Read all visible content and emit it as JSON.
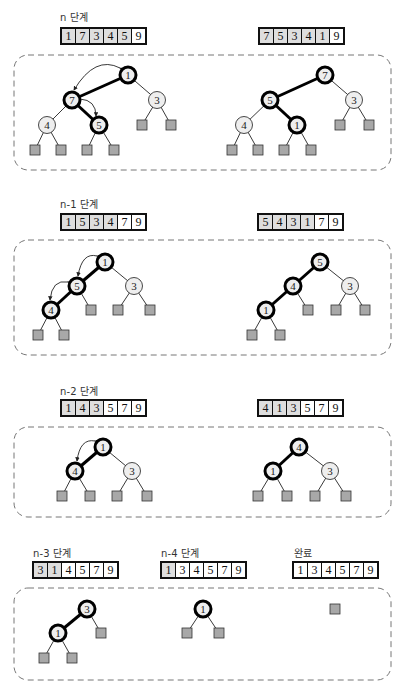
{
  "colors": {
    "edge": "#222222",
    "highlight": "#000000",
    "node_fill": "#eeeeee",
    "leaf_fill": "#a8a8a8",
    "dash": "#777777"
  },
  "stages": [
    {
      "label": "n 단계",
      "before_array": [
        {
          "v": "1",
          "s": true
        },
        {
          "v": "7",
          "s": true
        },
        {
          "v": "3",
          "s": true
        },
        {
          "v": "4",
          "s": true
        },
        {
          "v": "5",
          "s": true
        },
        {
          "v": "9",
          "s": false
        }
      ],
      "after_array": [
        {
          "v": "7",
          "s": true
        },
        {
          "v": "5",
          "s": true
        },
        {
          "v": "3",
          "s": true
        },
        {
          "v": "4",
          "s": true
        },
        {
          "v": "1",
          "s": true
        },
        {
          "v": "9",
          "s": false
        }
      ]
    },
    {
      "label": "n-1 단계",
      "before_array": [
        {
          "v": "1",
          "s": true
        },
        {
          "v": "5",
          "s": true
        },
        {
          "v": "3",
          "s": true
        },
        {
          "v": "4",
          "s": true
        },
        {
          "v": "7",
          "s": false
        },
        {
          "v": "9",
          "s": false
        }
      ],
      "after_array": [
        {
          "v": "5",
          "s": true
        },
        {
          "v": "4",
          "s": true
        },
        {
          "v": "3",
          "s": true
        },
        {
          "v": "1",
          "s": true
        },
        {
          "v": "7",
          "s": false
        },
        {
          "v": "9",
          "s": false
        }
      ]
    },
    {
      "label": "n-2 단계",
      "before_array": [
        {
          "v": "1",
          "s": true
        },
        {
          "v": "4",
          "s": true
        },
        {
          "v": "3",
          "s": true
        },
        {
          "v": "5",
          "s": false
        },
        {
          "v": "7",
          "s": false
        },
        {
          "v": "9",
          "s": false
        }
      ],
      "after_array": [
        {
          "v": "4",
          "s": true
        },
        {
          "v": "1",
          "s": true
        },
        {
          "v": "3",
          "s": true
        },
        {
          "v": "5",
          "s": false
        },
        {
          "v": "7",
          "s": false
        },
        {
          "v": "9",
          "s": false
        }
      ]
    },
    {
      "label": "n-3 단계",
      "array": [
        {
          "v": "3",
          "s": true
        },
        {
          "v": "1",
          "s": true
        },
        {
          "v": "4",
          "s": false
        },
        {
          "v": "5",
          "s": false
        },
        {
          "v": "7",
          "s": false
        },
        {
          "v": "9",
          "s": false
        }
      ]
    },
    {
      "label": "n-4 단계",
      "array": [
        {
          "v": "1",
          "s": true
        },
        {
          "v": "3",
          "s": false
        },
        {
          "v": "4",
          "s": false
        },
        {
          "v": "5",
          "s": false
        },
        {
          "v": "7",
          "s": false
        },
        {
          "v": "9",
          "s": false
        }
      ]
    },
    {
      "label": "완료",
      "array": [
        {
          "v": "1",
          "s": false
        },
        {
          "v": "3",
          "s": false
        },
        {
          "v": "4",
          "s": false
        },
        {
          "v": "5",
          "s": false
        },
        {
          "v": "7",
          "s": false
        },
        {
          "v": "9",
          "s": false
        }
      ]
    }
  ],
  "trees": {
    "boxes": [
      {
        "x": 14,
        "y": 55,
        "w": 377,
        "h": 115
      },
      {
        "x": 14,
        "y": 240,
        "w": 377,
        "h": 115
      },
      {
        "x": 14,
        "y": 427,
        "w": 377,
        "h": 90
      },
      {
        "x": 14,
        "y": 588,
        "w": 377,
        "h": 92
      }
    ],
    "nodes": [
      {
        "x": 128,
        "y": 75,
        "v": "1",
        "hl": true
      },
      {
        "x": 72,
        "y": 100,
        "v": "7",
        "hl": true
      },
      {
        "x": 157,
        "y": 100,
        "v": "3",
        "hl": false
      },
      {
        "x": 47,
        "y": 125,
        "v": "4",
        "hl": false
      },
      {
        "x": 99,
        "y": 125,
        "v": "5",
        "hl": true
      },
      {
        "x": 325,
        "y": 75,
        "v": "7",
        "hl": true
      },
      {
        "x": 270,
        "y": 100,
        "v": "5",
        "hl": true
      },
      {
        "x": 354,
        "y": 100,
        "v": "3",
        "hl": false
      },
      {
        "x": 244,
        "y": 125,
        "v": "4",
        "hl": false
      },
      {
        "x": 297,
        "y": 125,
        "v": "1",
        "hl": true
      },
      {
        "x": 105,
        "y": 262,
        "v": "1",
        "hl": true
      },
      {
        "x": 77,
        "y": 286,
        "v": "5",
        "hl": true
      },
      {
        "x": 134,
        "y": 286,
        "v": "3",
        "hl": false
      },
      {
        "x": 51,
        "y": 310,
        "v": "4",
        "hl": true
      },
      {
        "x": 320,
        "y": 262,
        "v": "5",
        "hl": true
      },
      {
        "x": 293,
        "y": 286,
        "v": "4",
        "hl": true
      },
      {
        "x": 350,
        "y": 286,
        "v": "3",
        "hl": false
      },
      {
        "x": 266,
        "y": 310,
        "v": "1",
        "hl": true
      },
      {
        "x": 103,
        "y": 447,
        "v": "1",
        "hl": true
      },
      {
        "x": 75,
        "y": 471,
        "v": "4",
        "hl": true
      },
      {
        "x": 132,
        "y": 471,
        "v": "3",
        "hl": false
      },
      {
        "x": 299,
        "y": 447,
        "v": "4",
        "hl": true
      },
      {
        "x": 273,
        "y": 471,
        "v": "1",
        "hl": true
      },
      {
        "x": 330,
        "y": 471,
        "v": "3",
        "hl": false
      },
      {
        "x": 87,
        "y": 609,
        "v": "3",
        "hl": true
      },
      {
        "x": 58,
        "y": 633,
        "v": "1",
        "hl": true
      },
      {
        "x": 203,
        "y": 609,
        "v": "1",
        "hl": true
      }
    ]
  }
}
